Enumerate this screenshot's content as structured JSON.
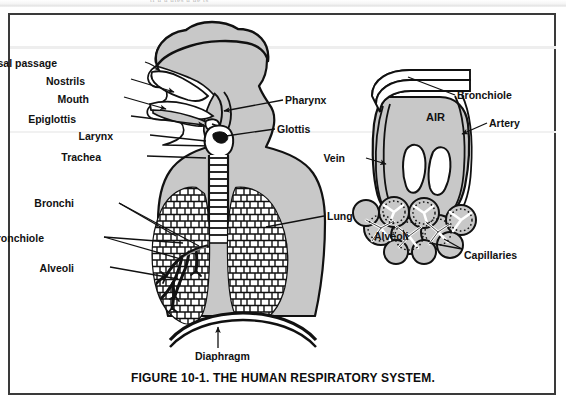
{
  "page": {
    "background_color": "#ffffff",
    "frame_border_color": "#3a3a3a",
    "body_gray": "#c8c8c8",
    "organ_gray": "#a8a8a8",
    "ink_color": "#111111",
    "ghost_text": "ti  u             u                            utes   u  ue   ts"
  },
  "caption": {
    "text": "FIGURE 10-1.  THE HUMAN RESPIRATORY SYSTEM."
  },
  "left_diagram": {
    "name": "human-respiratory-system-overview",
    "air_label": "",
    "labels": [
      {
        "key": "nasal_passage",
        "text": "Nasal passage",
        "align": "right",
        "x": 57,
        "y": 58
      },
      {
        "key": "nostrils",
        "text": "Nostrils",
        "align": "right",
        "x": 85,
        "y": 76
      },
      {
        "key": "mouth",
        "text": "Mouth",
        "align": "right",
        "x": 89,
        "y": 94
      },
      {
        "key": "epiglottis",
        "text": "Epiglottis",
        "align": "right",
        "x": 76,
        "y": 114
      },
      {
        "key": "larynx",
        "text": "Larynx",
        "align": "right",
        "x": 113,
        "y": 133
      },
      {
        "key": "trachea",
        "text": "Trachea",
        "align": "right",
        "x": 101,
        "y": 154
      },
      {
        "key": "bronchi",
        "text": "Bronchi",
        "align": "right",
        "x": 74,
        "y": 201
      },
      {
        "key": "bronchiole",
        "text": "Bronchiole",
        "align": "right",
        "x": 44,
        "y": 236
      },
      {
        "key": "alveoli",
        "text": "Alveoli",
        "align": "right",
        "x": 74,
        "y": 266
      },
      {
        "key": "pharynx",
        "text": "Pharynx",
        "align": "left",
        "x": 285,
        "y": 97
      },
      {
        "key": "glottis",
        "text": "Glottis",
        "align": "left",
        "x": 277,
        "y": 126
      },
      {
        "key": "lung",
        "text": "Lung",
        "align": "left",
        "x": 327,
        "y": 213
      },
      {
        "key": "diaphragm",
        "text": "Diaphragm",
        "align": "left",
        "x": 195,
        "y": 352
      }
    ]
  },
  "right_diagram": {
    "name": "bronchiole-alveoli-detail",
    "air_label": "AIR",
    "labels": [
      {
        "key": "bronchiole",
        "text": "Bronchiole",
        "align": "left",
        "x": 457,
        "y": 92
      },
      {
        "key": "artery",
        "text": "Artery",
        "align": "left",
        "x": 489,
        "y": 120
      },
      {
        "key": "vein",
        "text": "Vein",
        "align": "right",
        "x": 345,
        "y": 155
      },
      {
        "key": "alveoli",
        "text": "Alveoli",
        "align": "left",
        "x": 374,
        "y": 232
      },
      {
        "key": "capillaries",
        "text": "Capillaries",
        "align": "left",
        "x": 464,
        "y": 251
      }
    ]
  }
}
